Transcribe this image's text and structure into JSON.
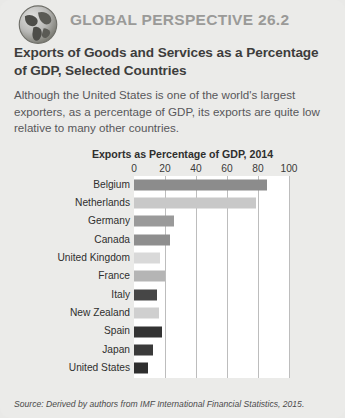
{
  "header": {
    "eyebrow": "GLOBAL PERSPECTIVE 26.2",
    "globe_icon": "globe-icon",
    "title": "Exports of Goods and Services as a Percentage of GDP, Selected Countries",
    "intro": "Although the United States is one of the world's largest exporters, as a percentage of GDP, its exports are quite low relative to many other countries."
  },
  "source": {
    "prefix": "Source: Derived by authors from ",
    "italic": "IMF International Financial Statistics,",
    "suffix": " 2015."
  },
  "colors": {
    "panel_bg": "#ebebe9",
    "plot_bg": "#ffffff",
    "gridline": "#bdbdbd",
    "eyebrow": "#9a9a98",
    "text": "#2f2f2e"
  },
  "chart_data": {
    "type": "bar",
    "orientation": "horizontal",
    "title": "Exports as Percentage of GDP, 2014",
    "xlabel": "",
    "ylabel": "",
    "xlim": [
      0,
      100
    ],
    "ticks": [
      0,
      20,
      40,
      60,
      80,
      100
    ],
    "grid": true,
    "legend": "none",
    "categories": [
      "Belgium",
      "Netherlands",
      "Germany",
      "Canada",
      "United Kingdom",
      "France",
      "Italy",
      "New Zealand",
      "Spain",
      "Japan",
      "United States"
    ],
    "values": [
      86,
      79,
      26,
      23,
      17,
      20,
      15,
      16,
      18,
      12,
      9
    ],
    "bar_colors": [
      "#8c8c8c",
      "#c8c8c8",
      "#9a9a9a",
      "#8e8e8e",
      "#d9d9d9",
      "#b5b5b5",
      "#464646",
      "#cfcfcf",
      "#333333",
      "#3a3a3a",
      "#2e2e2e"
    ]
  }
}
